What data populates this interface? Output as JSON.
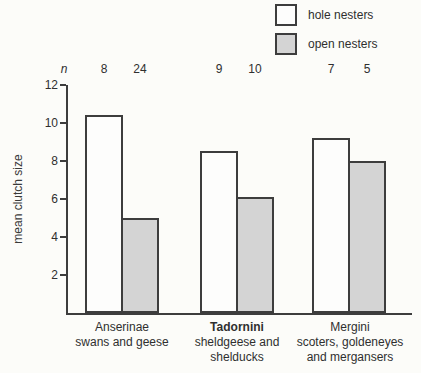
{
  "figure": {
    "ylabel": "mean clutch size",
    "sample_size_symbol": "n"
  },
  "legend": {
    "items": [
      {
        "label": "hole nesters",
        "fill": "#fdfdfc"
      },
      {
        "label": "open nesters",
        "fill": "#d4d4d4"
      }
    ]
  },
  "colors": {
    "outline": "#3d3d3d",
    "text": "#2f2f2f",
    "background": "#fcfcf9",
    "hole_fill": "#fdfdfc",
    "open_fill": "#d4d4d4"
  },
  "chart_data": {
    "type": "bar",
    "title": "",
    "xlabel": "",
    "ylabel": "mean clutch size",
    "ylim": [
      0,
      12
    ],
    "yticks": [
      2,
      4,
      6,
      8,
      10,
      12
    ],
    "grid": false,
    "legend_position": "top-right",
    "categories": [
      "Anserinae swans and geese",
      "Tadornini sheldgeese and shelducks",
      "Mergini scoters, goldeneyes and mergansers"
    ],
    "category_label_lines": [
      [
        "Anserinae",
        "swans and geese"
      ],
      [
        "Tadornini",
        "sheldgeese and",
        "shelducks"
      ],
      [
        "Mergini",
        "scoters, goldeneyes",
        "and mergansers"
      ]
    ],
    "series": [
      {
        "name": "hole nesters",
        "values": [
          10.4,
          8.5,
          9.2
        ],
        "n": [
          8,
          9,
          7
        ]
      },
      {
        "name": "open nesters",
        "values": [
          5.0,
          6.1,
          8.0
        ],
        "n": [
          24,
          10,
          5
        ]
      }
    ]
  }
}
